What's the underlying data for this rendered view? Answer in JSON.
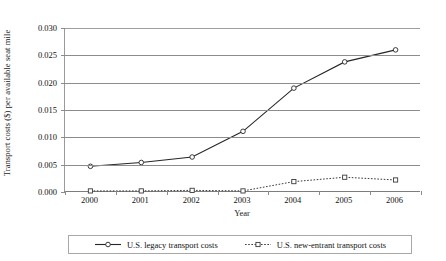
{
  "chart_data": {
    "type": "line",
    "title": "",
    "xlabel": "Year",
    "ylabel": "Transport costs ($) per available seat mile",
    "categories": [
      "2000",
      "2001",
      "2002",
      "2003",
      "2004",
      "2005",
      "2006"
    ],
    "x": [
      2000,
      2001,
      2002,
      2003,
      2004,
      2005,
      2006
    ],
    "ylim": [
      0.0,
      0.03
    ],
    "ytick_labels": [
      "0.000",
      "0.005",
      "0.010",
      "0.015",
      "0.020",
      "0.025",
      "0.030"
    ],
    "ytick_values": [
      0.0,
      0.005,
      0.01,
      0.015,
      0.02,
      0.025,
      0.03
    ],
    "grid": "horizontal",
    "legend_position": "bottom",
    "series": [
      {
        "name": "U.S. legacy transport costs",
        "values": [
          0.0047,
          0.0054,
          0.0064,
          0.0111,
          0.019,
          0.0238,
          0.026
        ],
        "line_style": "solid",
        "marker": "circle-open",
        "color": "#262626"
      },
      {
        "name": "U.S. new-entrant transport costs",
        "values": [
          0.0002,
          0.0002,
          0.0003,
          0.0002,
          0.0019,
          0.0027,
          0.0022
        ],
        "line_style": "dotted",
        "marker": "square-open",
        "color": "#3a3a3a"
      }
    ]
  },
  "legend": {
    "entries": [
      {
        "label": "U.S. legacy transport costs"
      },
      {
        "label": "U.S. new-entrant transport costs"
      }
    ]
  },
  "colors": {
    "background": "#ffffff",
    "axis": "#8c8c8c",
    "grid": "#8c8c8c",
    "text": "#1a1a1a",
    "legacy_series": "#262626",
    "newentrant_series": "#3a3a3a"
  }
}
